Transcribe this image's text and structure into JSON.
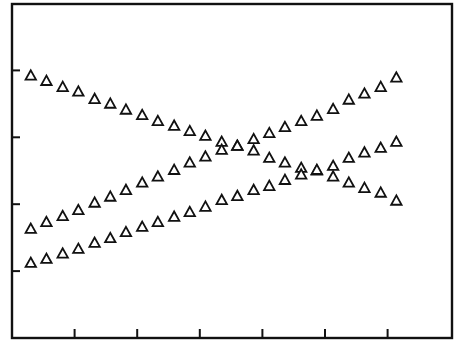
{
  "chart_data": {
    "type": "scatter",
    "title": "",
    "xlabel": "",
    "ylabel": "",
    "xlim": [
      0,
      7
    ],
    "ylim": [
      0,
      5
    ],
    "x_ticks": [
      1,
      2,
      3,
      4,
      5,
      6
    ],
    "y_ticks": [
      1,
      2,
      3,
      4
    ],
    "x_tick_labels": [],
    "y_tick_labels": [],
    "grid": false,
    "legend": null,
    "marker": "open-triangle",
    "colors": {
      "axis": "#111111",
      "marker_stroke": "#111111",
      "marker_fill": "#ffffff",
      "background": "#ffffff"
    },
    "x": [
      0.3,
      0.55,
      0.81,
      1.06,
      1.32,
      1.57,
      1.82,
      2.08,
      2.33,
      2.59,
      2.84,
      3.09,
      3.35,
      3.6,
      3.86,
      4.11,
      4.36,
      4.62,
      4.87,
      5.13,
      5.38,
      5.63,
      5.89,
      6.14
    ],
    "series": [
      {
        "name": "series-a-falling",
        "values": [
          3.92,
          3.84,
          3.75,
          3.68,
          3.57,
          3.5,
          3.41,
          3.33,
          3.24,
          3.17,
          3.09,
          3.02,
          2.93,
          2.87,
          2.8,
          2.69,
          2.62,
          2.54,
          2.5,
          2.41,
          2.32,
          2.24,
          2.17,
          2.05
        ]
      },
      {
        "name": "series-b-rising-upper",
        "values": [
          1.63,
          1.73,
          1.82,
          1.91,
          2.02,
          2.11,
          2.21,
          2.32,
          2.41,
          2.51,
          2.62,
          2.71,
          2.81,
          2.87,
          2.97,
          3.06,
          3.15,
          3.24,
          3.32,
          3.42,
          3.56,
          3.65,
          3.75,
          3.89
        ]
      },
      {
        "name": "series-c-rising-lower",
        "values": [
          1.12,
          1.18,
          1.26,
          1.33,
          1.42,
          1.49,
          1.58,
          1.66,
          1.73,
          1.81,
          1.88,
          1.96,
          2.06,
          2.12,
          2.21,
          2.27,
          2.36,
          2.44,
          2.51,
          2.57,
          2.69,
          2.77,
          2.84,
          2.93
        ]
      }
    ]
  }
}
